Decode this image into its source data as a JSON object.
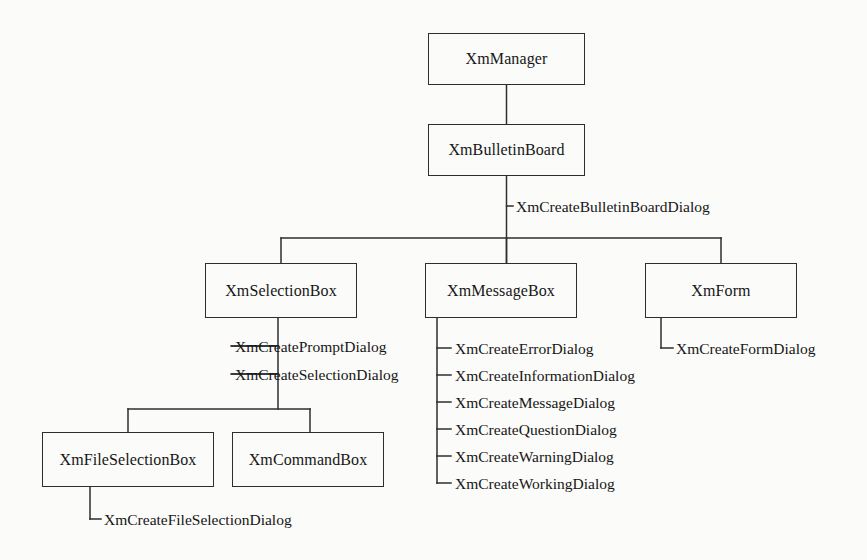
{
  "diagram": {
    "type": "tree-hierarchy",
    "background_color": "#fbfbf9",
    "line_color": "#2e2e2e",
    "text_color": "#161616",
    "nodes": [
      {
        "id": "xmmanager",
        "label": "XmManager",
        "x": 428,
        "y": 33,
        "w": 157,
        "h": 52
      },
      {
        "id": "xmbulletinboard",
        "label": "XmBulletinBoard",
        "x": 428,
        "y": 124,
        "w": 157,
        "h": 52
      },
      {
        "id": "xmselectionbox",
        "label": "XmSelectionBox",
        "x": 205,
        "y": 263,
        "w": 152,
        "h": 55
      },
      {
        "id": "xmmessagebox",
        "label": "XmMessageBox",
        "x": 425,
        "y": 263,
        "w": 152,
        "h": 55
      },
      {
        "id": "xmform",
        "label": "XmForm",
        "x": 645,
        "y": 263,
        "w": 152,
        "h": 55
      },
      {
        "id": "xmfileselectionbox",
        "label": "XmFileSelectionBox",
        "x": 42,
        "y": 432,
        "w": 172,
        "h": 55
      },
      {
        "id": "xmcommandbox",
        "label": "XmCommandBox",
        "x": 232,
        "y": 432,
        "w": 152,
        "h": 55
      }
    ],
    "leaves": [
      {
        "id": "createbulletinboarddialog",
        "label": "XmCreateBulletinBoardDialog",
        "x": 516,
        "y": 199,
        "parent": "xmbulletinboard"
      },
      {
        "id": "createpromptdialog",
        "label": "XmCreatePromptDialog",
        "x": 235,
        "y": 340,
        "parent": "xmselectionbox"
      },
      {
        "id": "createselectiondialog",
        "label": "XmCreateSelectionDialog",
        "x": 235,
        "y": 368,
        "parent": "xmselectionbox"
      },
      {
        "id": "createerrordialog",
        "label": "XmCreateErrorDialog",
        "x": 455,
        "y": 342,
        "parent": "xmmessagebox"
      },
      {
        "id": "createinformationdialog",
        "label": "XmCreateInformationDialog",
        "x": 455,
        "y": 369,
        "parent": "xmmessagebox"
      },
      {
        "id": "createmessagedialog",
        "label": "XmCreateMessageDialog",
        "x": 455,
        "y": 396,
        "parent": "xmmessagebox"
      },
      {
        "id": "createquestiondialog",
        "label": "XmCreateQuestionDialog",
        "x": 455,
        "y": 423,
        "parent": "xmmessagebox"
      },
      {
        "id": "createwarningdialog",
        "label": "XmCreateWarningDialog",
        "x": 455,
        "y": 450,
        "parent": "xmmessagebox"
      },
      {
        "id": "createworkingdialog",
        "label": "XmCreateWorkingDialog",
        "x": 455,
        "y": 477,
        "parent": "xmmessagebox"
      },
      {
        "id": "createformdialog",
        "label": "XmCreateFormDialog",
        "x": 676,
        "y": 342,
        "parent": "xmform"
      },
      {
        "id": "createfileselectiondialog",
        "label": "XmCreateFileSelectionDialog",
        "x": 104,
        "y": 513,
        "parent": "xmfileselectionbox"
      }
    ]
  }
}
